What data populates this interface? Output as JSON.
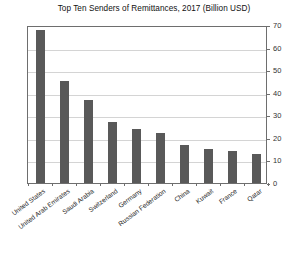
{
  "chart_data": {
    "type": "bar",
    "title": "Top Ten Senders of Remittances, 2017 (Billion USD)",
    "xlabel": "",
    "ylabel": "",
    "categories": [
      "United States",
      "United Arab Emirates",
      "Saudi Arabia",
      "Switzerland",
      "Germany",
      "Russian Federation",
      "China",
      "Kuwait",
      "France",
      "Qatar"
    ],
    "values": [
      68,
      45,
      37,
      27,
      24,
      22,
      17,
      15,
      14,
      13
    ],
    "ylim": [
      0,
      70
    ],
    "yticks": [
      0,
      10,
      20,
      30,
      40,
      50,
      60,
      70
    ],
    "ytick_labels": [
      "0",
      "10",
      "20",
      "30",
      "40",
      "50",
      "60",
      "70"
    ],
    "y_axis_position": "right",
    "grid": true,
    "grid_axis": "y",
    "legend": false,
    "bar_color": "#595959",
    "grid_color": "#d4d4d4",
    "frame_color": "#6e6e6e",
    "background_color": "#ffffff"
  }
}
